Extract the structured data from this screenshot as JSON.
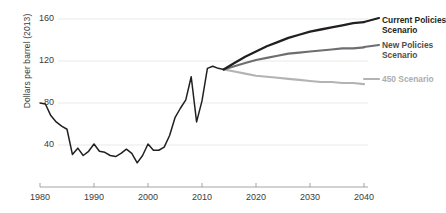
{
  "chart_data": {
    "type": "line",
    "title": "",
    "xlabel": "",
    "ylabel": "Dollars per barrel (2013)",
    "xlim": [
      1980,
      2040
    ],
    "ylim": [
      0,
      170
    ],
    "xticks": [
      1980,
      1990,
      2000,
      2010,
      2020,
      2030,
      2040
    ],
    "yticks": [
      40,
      80,
      120,
      160
    ],
    "grid": "horizontal",
    "legend_position": "right",
    "colors": {
      "current_policies": "#231f20",
      "new_policies": "#6d6e71",
      "scenario_450": "#b3b3b3",
      "gridline": "#e6e6e6",
      "axis": "#9a9a9a",
      "tick_text": "#3b3b3b"
    },
    "series": [
      {
        "name": "Historical",
        "color": "#231f20",
        "x": [
          1980,
          1981,
          1982,
          1983,
          1984,
          1985,
          1986,
          1987,
          1988,
          1989,
          1990,
          1991,
          1992,
          1993,
          1994,
          1995,
          1996,
          1997,
          1998,
          1999,
          2000,
          2001,
          2002,
          2003,
          2004,
          2005,
          2006,
          2007,
          2008,
          2009,
          2010,
          2011,
          2012,
          2013,
          2014
        ],
        "values": [
          80,
          79,
          68,
          62,
          58,
          55,
          31,
          37,
          30,
          34,
          41,
          34,
          33,
          30,
          29,
          32,
          36,
          32,
          23,
          30,
          41,
          35,
          35,
          38,
          49,
          66,
          75,
          83,
          105,
          62,
          82,
          113,
          115,
          113,
          112
        ]
      },
      {
        "name": "Current Policies Scenario",
        "color": "#231f20",
        "x": [
          2014,
          2016,
          2018,
          2020,
          2022,
          2024,
          2026,
          2028,
          2030,
          2032,
          2034,
          2036,
          2038,
          2040
        ],
        "values": [
          112,
          118,
          124,
          129,
          134,
          138,
          142,
          145,
          148,
          150,
          152,
          154,
          156,
          157
        ]
      },
      {
        "name": "New Policies Scenario",
        "color": "#6d6e71",
        "x": [
          2014,
          2016,
          2018,
          2020,
          2022,
          2024,
          2026,
          2028,
          2030,
          2032,
          2034,
          2036,
          2038,
          2040
        ],
        "values": [
          112,
          115,
          118,
          121,
          123,
          125,
          127,
          128,
          129,
          130,
          131,
          132,
          132,
          133
        ]
      },
      {
        "name": "450 Scenario",
        "color": "#b3b3b3",
        "x": [
          2014,
          2016,
          2018,
          2020,
          2022,
          2024,
          2026,
          2028,
          2030,
          2032,
          2034,
          2036,
          2038,
          2040
        ],
        "values": [
          112,
          110,
          108,
          106,
          105,
          104,
          103,
          102,
          101,
          100,
          100,
          99,
          99,
          98
        ]
      }
    ],
    "legend": [
      {
        "label_line1": "Current Policies",
        "label_line2": "Scenario",
        "color": "#231f20"
      },
      {
        "label_line1": "New Policies",
        "label_line2": "Scenario",
        "color": "#6d6e71"
      },
      {
        "label_line1": "450 Scenario",
        "label_line2": "",
        "color": "#b3b3b3"
      }
    ]
  }
}
